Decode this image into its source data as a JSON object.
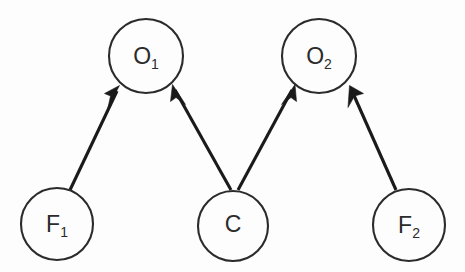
{
  "diagram": {
    "type": "directed-graph",
    "background_color": "#fdfdfd",
    "stroke_color": "#1a1a1a",
    "node_stroke_color": "#2b2b2b",
    "node_fill_color": "#fdfdfd",
    "nodes": [
      {
        "id": "O1",
        "label": "O",
        "subscript": "1",
        "cx": 146,
        "cy": 56,
        "r": 37
      },
      {
        "id": "O2",
        "label": "O",
        "subscript": "2",
        "cx": 319,
        "cy": 56,
        "r": 37
      },
      {
        "id": "F1",
        "label": "F",
        "subscript": "1",
        "cx": 57,
        "cy": 224,
        "r": 36
      },
      {
        "id": "C",
        "label": "C",
        "subscript": "",
        "cx": 233,
        "cy": 226,
        "r": 35
      },
      {
        "id": "F2",
        "label": "F",
        "subscript": "2",
        "cx": 409,
        "cy": 225,
        "r": 36
      }
    ],
    "edges": [
      {
        "id": "F1-O1",
        "from": "F1",
        "to": "O1",
        "arrow": "to",
        "x1": 70,
        "y1": 190,
        "x2": 119,
        "y2": 87
      },
      {
        "id": "C-O1",
        "from": "C",
        "to": "O1",
        "arrow": "to",
        "x1": 231,
        "y1": 190,
        "x2": 173,
        "y2": 86
      },
      {
        "id": "C-O2",
        "from": "C",
        "to": "O2",
        "arrow": "to",
        "x1": 238,
        "y1": 190,
        "x2": 294,
        "y2": 86
      },
      {
        "id": "F2-O2",
        "from": "F2",
        "to": "O2",
        "arrow": "to",
        "x1": 396,
        "y1": 190,
        "x2": 350,
        "y2": 86
      }
    ]
  }
}
